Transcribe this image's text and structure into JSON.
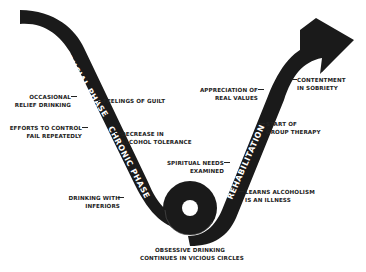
{
  "diagram": {
    "colors": {
      "band": "#1a1a1a",
      "background": "#ffffff",
      "text": "#222222",
      "phase_text": "#ffffff"
    },
    "phases": [
      {
        "id": "crucial",
        "label": "CRUCIAL PHASE"
      },
      {
        "id": "chronic",
        "label": "CHRONIC PHASE"
      },
      {
        "id": "rehabilitation",
        "label": "REHABILITATION"
      }
    ],
    "labels": {
      "occasional_relief": [
        "OCCASIONAL",
        "RELIEF DRINKING"
      ],
      "feelings_guilt": [
        "FEELINGS OF GUILT"
      ],
      "efforts_control": [
        "EFFORTS TO CONTROL",
        "FAIL REPEATEDLY"
      ],
      "decrease_tolerance": [
        "DECREASE IN",
        "ALCOHOL TOLERANCE"
      ],
      "drinking_inferiors": [
        "DRINKING WITH",
        "INFERIORS"
      ],
      "obsessive_drinking": [
        "OBSESSIVE DRINKING",
        "CONTINUES IN VICIOUS CIRCLES"
      ],
      "spiritual_needs": [
        "SPIRITUAL NEEDS",
        "EXAMINED"
      ],
      "learns_illness": [
        "LEARNS ALCOHOLISM",
        "IS AN ILLNESS"
      ],
      "group_therapy": [
        "START OF",
        "GROUP THERAPY"
      ],
      "real_values": [
        "APPRECIATION OF",
        "REAL VALUES"
      ],
      "contentment": [
        "CONTENTMENT",
        "IN SOBRIETY"
      ]
    }
  }
}
